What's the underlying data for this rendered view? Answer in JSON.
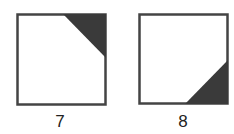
{
  "figures": [
    {
      "label": "7",
      "box": {
        "x": 17,
        "y": 14,
        "w": 89,
        "h": 91
      },
      "triangle": [
        [
          63,
          14
        ],
        [
          106,
          14
        ],
        [
          106,
          58
        ]
      ],
      "shaded_corner": "top-right"
    },
    {
      "label": "8",
      "box": {
        "x": 139,
        "y": 14,
        "w": 89,
        "h": 90
      },
      "triangle": [
        [
          185,
          104
        ],
        [
          228,
          104
        ],
        [
          228,
          60
        ]
      ],
      "shaded_corner": "bottom-right"
    }
  ],
  "colors": {
    "stroke": "#444444",
    "fill": "#3a3a3a",
    "background": "#ffffff"
  }
}
